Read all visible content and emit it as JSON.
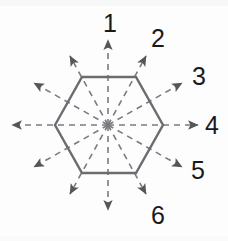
{
  "figure": {
    "background_color": "#fdfdfd",
    "shape": {
      "name": "hexagon",
      "stroke_color": "#6b6b70",
      "stroke_width": 2.4,
      "fill": "none",
      "center": {
        "x": 108,
        "y": 125
      },
      "vertices": [
        {
          "x": 55,
          "y": 125
        },
        {
          "x": 82,
          "y": 77
        },
        {
          "x": 136,
          "y": 77
        },
        {
          "x": 163,
          "y": 125
        },
        {
          "x": 136,
          "y": 173
        },
        {
          "x": 82,
          "y": 173
        }
      ]
    },
    "rays": {
      "count": 12,
      "stroke_color": "#7a7a80",
      "stroke_width": 1.6,
      "dash_pattern": "6 5",
      "arrowhead_color": "#55555a",
      "angles_deg": [
        90,
        60,
        30,
        0,
        -30,
        -60,
        -90,
        -120,
        -150,
        180,
        150,
        120
      ],
      "items": [
        {
          "angle_deg": 90,
          "label": "1",
          "labeled": true,
          "tip": {
            "x": 108,
            "y": 40
          }
        },
        {
          "angle_deg": 60,
          "label": "2",
          "labeled": true,
          "tip": {
            "x": 146,
            "y": 56
          }
        },
        {
          "angle_deg": 30,
          "label": "3",
          "labeled": true,
          "tip": {
            "x": 182,
            "y": 83
          }
        },
        {
          "angle_deg": 0,
          "label": "4",
          "labeled": true,
          "tip": {
            "x": 198,
            "y": 125
          }
        },
        {
          "angle_deg": -30,
          "label": "5",
          "labeled": true,
          "tip": {
            "x": 182,
            "y": 167
          }
        },
        {
          "angle_deg": -60,
          "label": "6",
          "labeled": true,
          "tip": {
            "x": 146,
            "y": 194
          }
        },
        {
          "angle_deg": -90,
          "label": "",
          "labeled": false,
          "tip": {
            "x": 108,
            "y": 210
          }
        },
        {
          "angle_deg": -120,
          "label": "",
          "labeled": false,
          "tip": {
            "x": 70,
            "y": 194
          }
        },
        {
          "angle_deg": -150,
          "label": "",
          "labeled": false,
          "tip": {
            "x": 34,
            "y": 167
          }
        },
        {
          "angle_deg": 180,
          "label": "",
          "labeled": false,
          "tip": {
            "x": 12,
            "y": 125
          }
        },
        {
          "angle_deg": 150,
          "label": "",
          "labeled": false,
          "tip": {
            "x": 34,
            "y": 83
          }
        },
        {
          "angle_deg": 120,
          "label": "",
          "labeled": false,
          "tip": {
            "x": 70,
            "y": 56
          }
        }
      ]
    },
    "labels": [
      {
        "id": "label-1",
        "text": "1",
        "x": 103,
        "y": 11
      },
      {
        "id": "label-2",
        "text": "2",
        "x": 151,
        "y": 26
      },
      {
        "id": "label-3",
        "text": "3",
        "x": 192,
        "y": 64
      },
      {
        "id": "label-4",
        "text": "4",
        "x": 205,
        "y": 113
      },
      {
        "id": "label-5",
        "text": "5",
        "x": 191,
        "y": 158
      },
      {
        "id": "label-6",
        "text": "6",
        "x": 151,
        "y": 203
      }
    ]
  }
}
